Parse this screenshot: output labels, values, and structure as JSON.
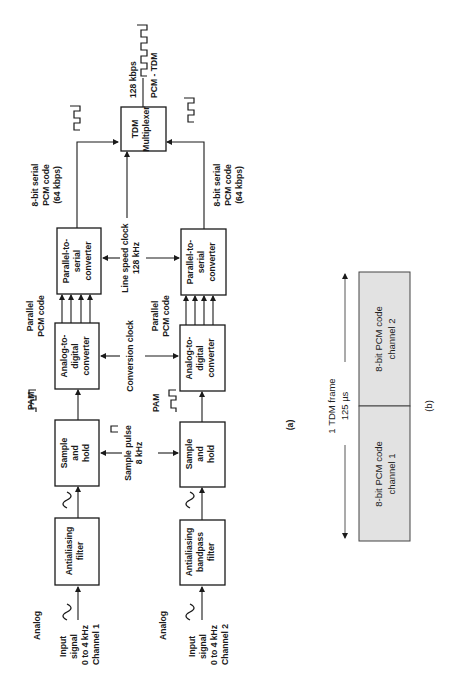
{
  "figure_a": {
    "label": "(a)",
    "channel1": {
      "input_label": "Analog",
      "input_lines": [
        "Input",
        "signal",
        "0 to 4 kHz",
        "Channel 1"
      ],
      "filter_lines": [
        "Antialiasing",
        "filter"
      ],
      "sh_lines": [
        "Sample",
        "and",
        "hold"
      ],
      "pam_label": "PAM",
      "adc_lines": [
        "Analog-to-",
        "digital",
        "converter"
      ],
      "parallel_lines": [
        "Parallel",
        "PCM code"
      ],
      "ps_lines": [
        "Parallel-to-",
        "serial",
        "converter"
      ],
      "serial_lines": [
        "8-bit serial",
        "PCM code",
        "(64 kbps)"
      ]
    },
    "channel2": {
      "input_label": "Analog",
      "input_lines": [
        "Input",
        "signal",
        "0 to 4 kHz",
        "Channel 2"
      ],
      "filter_lines": [
        "Antialiasing",
        "bandpass",
        "filter"
      ],
      "sh_lines": [
        "Sample",
        "and",
        "hold"
      ],
      "pam_label": "PAM",
      "adc_lines": [
        "Analog-to-",
        "digital",
        "converter"
      ],
      "parallel_lines": [
        "Parallel",
        "PCM code"
      ],
      "ps_lines": [
        "Parallel-to-",
        "serial",
        "converter"
      ],
      "serial_lines": [
        "8-bit serial",
        "PCM code",
        "(64 kbps)"
      ]
    },
    "sample_pulse_lines": [
      "Sample pulse",
      "8 kHz"
    ],
    "conversion_clock": "Conversion clock",
    "line_clock_lines": [
      "Line speed clock",
      "128 kHz"
    ],
    "mux_lines": [
      "TDM",
      "Multiplexer"
    ],
    "output_lines": [
      "128 kbps",
      "PCM - TDM"
    ]
  },
  "figure_b": {
    "label": "(b)",
    "frame_lines": [
      "1 TDM frame",
      "125 µs"
    ],
    "slot1_lines": [
      "8-bit PCM code",
      "channel 1"
    ],
    "slot2_lines": [
      "8-bit PCM code",
      "channel 2"
    ],
    "slot_fill": "#e2e2e2"
  }
}
